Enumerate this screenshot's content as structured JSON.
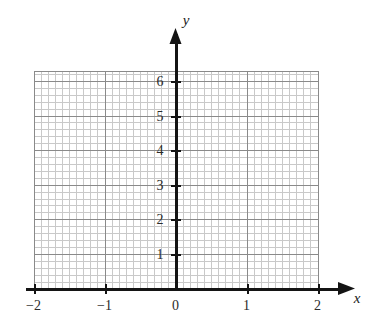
{
  "chart_data": {
    "type": "scatter",
    "title": "",
    "xlabel": "x",
    "ylabel": "y",
    "xlim": [
      -2.12,
      2.35
    ],
    "ylim": [
      -0.28,
      6.45
    ],
    "grid": true,
    "legend": null,
    "series": [],
    "x": [],
    "values": [],
    "xticks": [
      -2,
      -1,
      0,
      1,
      2
    ],
    "xtick_labels": [
      "−2",
      "−1",
      "0",
      "1",
      "2"
    ],
    "yticks": [
      1,
      2,
      3,
      4,
      5,
      6
    ],
    "ytick_labels": [
      "1",
      "2",
      "3",
      "4",
      "5",
      "6"
    ],
    "x_minor_per_unit": 10,
    "y_minor_per_unit": 5,
    "grid_x_range": [
      -2,
      2
    ],
    "grid_y_range": [
      0,
      6.3
    ],
    "annotations": []
  },
  "axes": {
    "x_axis_label": "x",
    "y_axis_label": "y",
    "origin_label": "0"
  },
  "colors": {
    "axis": "#141414",
    "major_grid": "#8a8a8a",
    "minor_grid": "#c9c9c9",
    "tick_text": "#2b2b2b",
    "background": "#ffffff"
  }
}
